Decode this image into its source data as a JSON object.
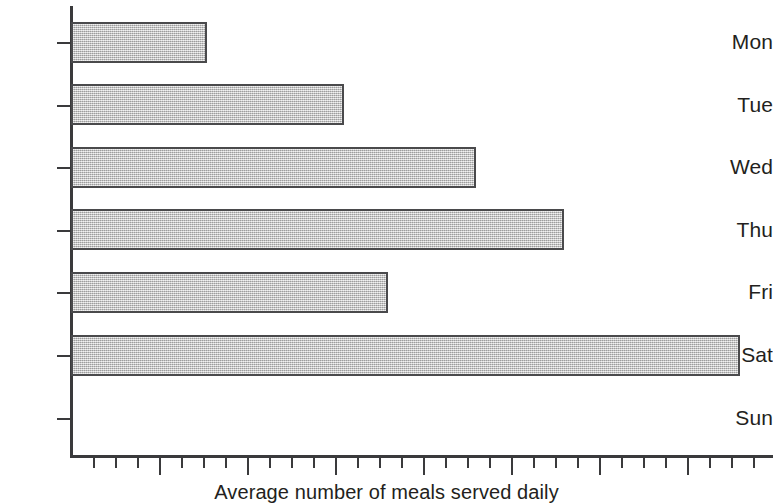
{
  "chart_data": {
    "type": "bar",
    "orientation": "horizontal",
    "title": "",
    "subtitle": "",
    "xlabel": "Average number of meals served daily",
    "ylabel": "",
    "categories": [
      "Mon",
      "Tue",
      "Wed",
      "Thu",
      "Fri",
      "Sat",
      "Sun"
    ],
    "values": [
      1.55,
      3.1,
      4.6,
      5.6,
      3.6,
      7.6,
      0
    ],
    "series": [
      {
        "name": "Average number of meals served daily",
        "values": [
          1.55,
          3.1,
          4.6,
          5.6,
          3.6,
          7.6,
          0
        ]
      }
    ],
    "xlim": [
      0,
      8
    ],
    "ylim": null,
    "grid": false,
    "legend": false,
    "legend_position": "none",
    "x_tick_labels": [],
    "x_major_tick_interval": 1,
    "x_minor_ticks_per_major": 4,
    "annotations": [],
    "bar_fill_color": "#c2c2c2",
    "bar_edge_color": "#4a4a4c",
    "axis_color": "#3a3a3c",
    "text_color": "#231f20",
    "background_color": "#ffffff"
  },
  "axes": {
    "x_title": "Average number of meals served daily"
  },
  "y_axis": {
    "ticks": [
      {
        "label": "Mon"
      },
      {
        "label": "Tue"
      },
      {
        "label": "Wed"
      },
      {
        "label": "Thu"
      },
      {
        "label": "Fri"
      },
      {
        "label": "Sat"
      },
      {
        "label": "Sun"
      }
    ]
  }
}
